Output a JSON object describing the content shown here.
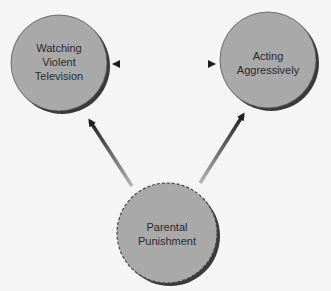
{
  "diagram": {
    "nodes": [
      {
        "id": "tv",
        "lines": [
          "Watching",
          "Violent",
          "Television"
        ],
        "border": "solid"
      },
      {
        "id": "aggr",
        "lines": [
          "Acting",
          "Aggressively"
        ],
        "border": "solid"
      },
      {
        "id": "punish",
        "lines": [
          "Parental",
          "Punishment"
        ],
        "border": "dashed"
      }
    ],
    "edges": [
      {
        "from": "tv",
        "to": "aggr",
        "type": "bidirectional"
      },
      {
        "from": "punish",
        "to": "tv",
        "type": "directed"
      },
      {
        "from": "punish",
        "to": "aggr",
        "type": "directed"
      }
    ],
    "colors": {
      "node_fill": "#a9a9a9",
      "node_shadow": "#3a3a3a",
      "arrow_dark": "#1e1e1e",
      "arrow_light": "#b5b5b5",
      "text": "#2a2a2a"
    }
  }
}
